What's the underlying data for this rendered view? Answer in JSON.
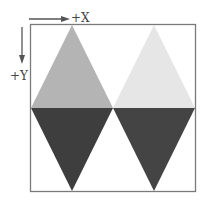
{
  "axes": {
    "x_label": "+X",
    "y_label": "+Y"
  },
  "colors": {
    "frame": "#7a7a7a",
    "arrow": "#555555",
    "top_left_triangle": "#b4b4b4",
    "top_right_triangle": "#e6e6e6",
    "bottom_left_triangle": "#3e3e3e",
    "bottom_right_triangle": "#444444"
  },
  "shapes": [
    {
      "name": "top-left-triangle",
      "shade": "medium gray",
      "orientation": "up"
    },
    {
      "name": "top-right-triangle",
      "shade": "light gray",
      "orientation": "up"
    },
    {
      "name": "bottom-left-triangle",
      "shade": "dark gray",
      "orientation": "down"
    },
    {
      "name": "bottom-right-triangle",
      "shade": "dark gray",
      "orientation": "down"
    }
  ]
}
